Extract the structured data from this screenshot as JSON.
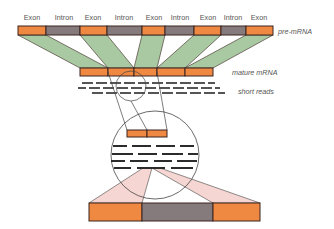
{
  "diagram": {
    "colors": {
      "exon": "#ef8840",
      "intron": "#857b7d",
      "splice_fan": "#a8c9a2",
      "zoom_fan": "#f6d6d2",
      "outline": "#3a2420",
      "reads": "#2b2b2b",
      "text": "#555555"
    },
    "pre_mrna": {
      "label": "pre-mRNA",
      "segments": [
        {
          "type": "exon",
          "label": "Exon"
        },
        {
          "type": "intron",
          "label": "Intron"
        },
        {
          "type": "exon",
          "label": "Exon"
        },
        {
          "type": "intron",
          "label": "Intron"
        },
        {
          "type": "exon",
          "label": "Exon"
        },
        {
          "type": "intron",
          "label": "Intron"
        },
        {
          "type": "exon",
          "label": "Exon"
        },
        {
          "type": "intron",
          "label": "Intron"
        },
        {
          "type": "exon",
          "label": "Exon"
        }
      ]
    },
    "mature_mrna": {
      "label": "mature mRNA",
      "exon_count": 5
    },
    "short_reads": {
      "label": "short reads",
      "rows": 3
    },
    "zoom_inset": {
      "exon_junction_segments": 2,
      "read_rows": 4
    },
    "bottom_bar": {
      "segments": [
        "exon",
        "intron",
        "exon"
      ]
    }
  }
}
